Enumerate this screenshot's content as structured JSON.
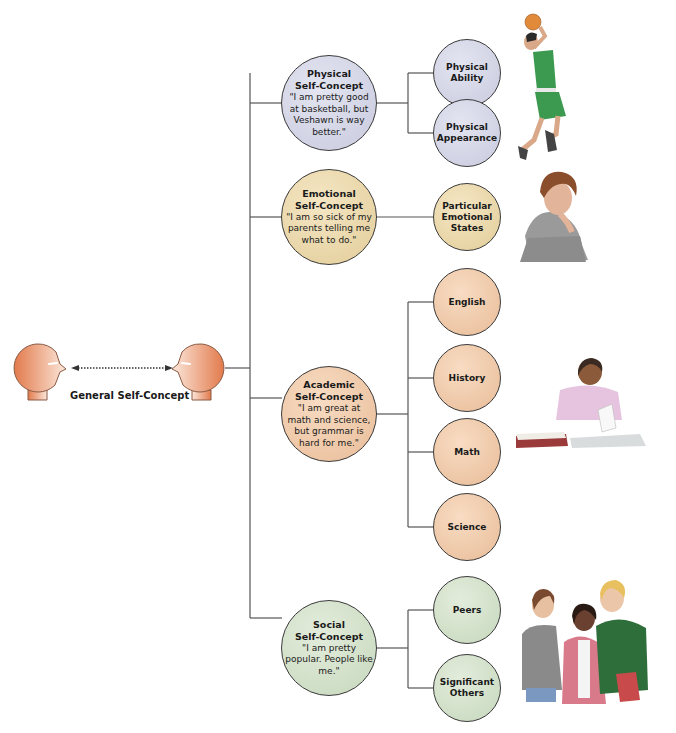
{
  "general": {
    "label": "General Self-Concept"
  },
  "domains": [
    {
      "key": "physical",
      "title_line1": "Physical",
      "title_line2": "Self-Concept",
      "quote": "\"I am pretty good at basketball, but Veshawn is way better.\"",
      "subs": [
        {
          "line1": "Physical",
          "line2": "Ability",
          "line3": ""
        },
        {
          "line1": "Physical",
          "line2": "Appearance",
          "line3": ""
        }
      ],
      "illustration": "basketball-player"
    },
    {
      "key": "emotional",
      "title_line1": "Emotional",
      "title_line2": "Self-Concept",
      "quote": "\"I am so sick of my parents telling me what to do.\"",
      "subs": [
        {
          "line1": "Particular",
          "line2": "Emotional",
          "line3": "States"
        }
      ],
      "illustration": "sulking-teen"
    },
    {
      "key": "academic",
      "title_line1": "Academic",
      "title_line2": "Self-Concept",
      "quote": "\"I am great at math and science, but grammar is hard for me.\"",
      "subs": [
        {
          "line1": "English",
          "line2": "",
          "line3": ""
        },
        {
          "line1": "History",
          "line2": "",
          "line3": ""
        },
        {
          "line1": "Math",
          "line2": "",
          "line3": ""
        },
        {
          "line1": "Science",
          "line2": "",
          "line3": ""
        }
      ],
      "illustration": "student-reading"
    },
    {
      "key": "social",
      "title_line1": "Social",
      "title_line2": "Self-Concept",
      "quote": "\"I am pretty popular. People like me.\"",
      "subs": [
        {
          "line1": "Peers",
          "line2": "",
          "line3": ""
        },
        {
          "line1": "Significant",
          "line2": "Others",
          "line3": ""
        }
      ],
      "illustration": "group-of-friends"
    }
  ],
  "colors": {
    "physical": "#c8cade",
    "emotional": "#e2cc98",
    "academic": "#e8bc98",
    "social": "#c6d8bc",
    "head": "#e07a4e",
    "line": "#555555"
  }
}
